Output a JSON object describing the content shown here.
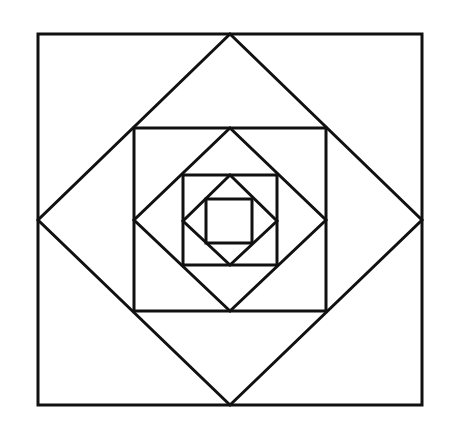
{
  "diagram": {
    "title": "",
    "stroke_color": "#111111",
    "background": "#ffffff",
    "shapes": [
      {
        "name": "outer-square",
        "type": "square",
        "points": "38,34 422,34 422,405 38,405"
      },
      {
        "name": "outer-diamond",
        "type": "diamond",
        "points": "230,34 422,220 230,405 38,220"
      },
      {
        "name": "second-square",
        "type": "square",
        "points": "134,128 326,128 326,311 134,311"
      },
      {
        "name": "second-diamond",
        "type": "diamond",
        "points": "230,128 326,220 230,311 134,220"
      },
      {
        "name": "third-square",
        "type": "square",
        "points": "183,175 277,175 277,265 183,265"
      },
      {
        "name": "third-diamond",
        "type": "diamond",
        "points": "230,175 277,221 230,265 183,221"
      },
      {
        "name": "inner-square",
        "type": "square",
        "points": "206,199 252,199 252,243 206,243"
      }
    ]
  }
}
